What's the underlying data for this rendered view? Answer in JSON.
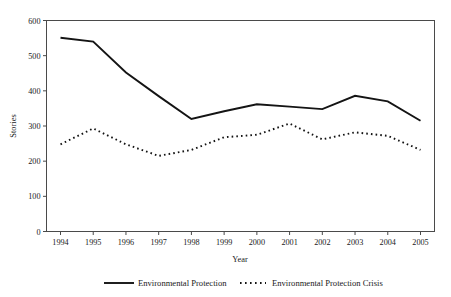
{
  "chart_data": {
    "type": "line",
    "title": "",
    "xlabel": "Year",
    "ylabel": "Stories",
    "categories": [
      "1994",
      "1995",
      "1996",
      "1997",
      "1998",
      "1999",
      "2000",
      "2001",
      "2002",
      "2003",
      "2004",
      "2005"
    ],
    "ylim": [
      0,
      600
    ],
    "yticks": [
      0,
      100,
      200,
      300,
      400,
      500,
      600
    ],
    "grid": false,
    "legend_position": "bottom",
    "series": [
      {
        "name": "Environmental Protection",
        "style": "solid",
        "color": "#141414",
        "values": [
          551,
          540,
          452,
          385,
          320,
          342,
          362,
          355,
          348,
          386,
          370,
          315
        ]
      },
      {
        "name": "Environmental Protection Crisis",
        "style": "dotted",
        "color": "#141414",
        "values": [
          248,
          293,
          248,
          215,
          232,
          268,
          275,
          307,
          262,
          282,
          272,
          232
        ]
      }
    ]
  },
  "axes": {
    "y_title": "Stories",
    "x_title": "Year",
    "y_tick_labels": [
      "600",
      "500",
      "400",
      "300",
      "200",
      "100",
      "0"
    ],
    "x_tick_labels": [
      "1994",
      "1995",
      "1996",
      "1997",
      "1998",
      "1999",
      "2000",
      "2001",
      "2002",
      "2003",
      "2004",
      "2005"
    ]
  },
  "legend": {
    "items": [
      {
        "label": "Environmental Protection",
        "style": "solid"
      },
      {
        "label": "Environmental Protection Crisis",
        "style": "dotted"
      }
    ]
  }
}
